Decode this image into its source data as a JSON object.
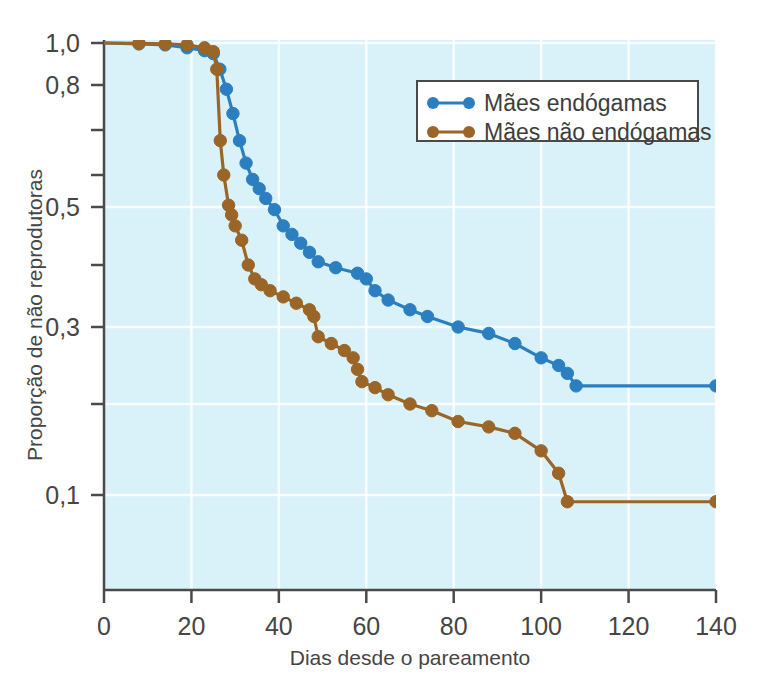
{
  "chart_data": {
    "type": "line",
    "title": "",
    "xlabel": "Dias desde o pareamento",
    "ylabel": "Proporção de não reprodutoras",
    "xlim": [
      0,
      140
    ],
    "ylim": [
      0.07,
      1.0
    ],
    "yscale": "log",
    "grid": true,
    "legend_position": "top-right",
    "background_color": "#d9f1f8",
    "grid_color": "#ffffff",
    "xticks": [
      0,
      20,
      40,
      60,
      80,
      100,
      120,
      140
    ],
    "xtick_labels": [
      "0",
      "20",
      "40",
      "60",
      "80",
      "100",
      "120",
      "140"
    ],
    "yticks": [
      1.0,
      0.8,
      0.7,
      0.6,
      0.5,
      0.4,
      0.3,
      0.2,
      0.1
    ],
    "ytick_labels": [
      "1,0",
      "0,8",
      "",
      "",
      "0,5",
      "",
      "0,3",
      "",
      "0,1"
    ],
    "ytick_labeled": [
      true,
      true,
      false,
      false,
      true,
      false,
      true,
      false,
      true
    ],
    "series": [
      {
        "name": "Mães endógamas",
        "color": "#2b7fc0",
        "marker": "circle",
        "points": [
          [
            0,
            1.0
          ],
          [
            8,
            0.995
          ],
          [
            14,
            0.99
          ],
          [
            19,
            0.975
          ],
          [
            23,
            0.96
          ],
          [
            25,
            0.945
          ],
          [
            26.5,
            0.87
          ],
          [
            28,
            0.79
          ],
          [
            29.5,
            0.735
          ],
          [
            31,
            0.675
          ],
          [
            32.5,
            0.625
          ],
          [
            34,
            0.585
          ],
          [
            35.5,
            0.555
          ],
          [
            37,
            0.525
          ],
          [
            39,
            0.495
          ],
          [
            41,
            0.465
          ],
          [
            43,
            0.45
          ],
          [
            45,
            0.435
          ],
          [
            47,
            0.42
          ],
          [
            49,
            0.405
          ],
          [
            53,
            0.395
          ],
          [
            58,
            0.385
          ],
          [
            60,
            0.375
          ],
          [
            62,
            0.355
          ],
          [
            65,
            0.34
          ],
          [
            70,
            0.325
          ],
          [
            74,
            0.315
          ],
          [
            81,
            0.3
          ],
          [
            88,
            0.29
          ],
          [
            94,
            0.275
          ],
          [
            100,
            0.255
          ],
          [
            104,
            0.245
          ],
          [
            106,
            0.235
          ],
          [
            108,
            0.22
          ],
          [
            140,
            0.22
          ]
        ]
      },
      {
        "name": "Mães não endógamas",
        "color": "#9a6526",
        "marker": "circle",
        "points": [
          [
            0,
            1.0
          ],
          [
            8,
            0.998
          ],
          [
            14,
            0.995
          ],
          [
            19,
            0.99
          ],
          [
            23,
            0.975
          ],
          [
            25,
            0.955
          ],
          [
            25.8,
            0.87
          ],
          [
            26.6,
            0.675
          ],
          [
            27.4,
            0.6
          ],
          [
            28.5,
            0.505
          ],
          [
            29.2,
            0.485
          ],
          [
            30,
            0.465
          ],
          [
            31.5,
            0.44
          ],
          [
            33,
            0.4
          ],
          [
            34.5,
            0.375
          ],
          [
            36,
            0.365
          ],
          [
            38,
            0.355
          ],
          [
            41,
            0.345
          ],
          [
            44,
            0.335
          ],
          [
            47,
            0.325
          ],
          [
            48,
            0.315
          ],
          [
            49,
            0.285
          ],
          [
            52,
            0.275
          ],
          [
            55,
            0.265
          ],
          [
            57,
            0.255
          ],
          [
            58,
            0.24
          ],
          [
            59,
            0.225
          ],
          [
            62,
            0.218
          ],
          [
            65,
            0.21
          ],
          [
            70,
            0.2
          ],
          [
            75,
            0.19
          ],
          [
            81,
            0.175
          ],
          [
            88,
            0.168
          ],
          [
            94,
            0.16
          ],
          [
            100,
            0.14
          ],
          [
            104,
            0.118
          ],
          [
            106,
            0.095
          ],
          [
            140,
            0.095
          ]
        ]
      }
    ]
  },
  "legend": {
    "items": [
      {
        "label": "Mães endógamas",
        "color": "#2b7fc0"
      },
      {
        "label": "Mães não endógamas",
        "color": "#9a6526"
      }
    ]
  },
  "axes": {
    "y_title": "Proporção de não reprodutoras",
    "x_title": "Dias desde o pareamento",
    "y_labels": [
      "1,0",
      "0,8",
      "0,5",
      "0,3",
      "0,1"
    ],
    "x_labels": [
      "0",
      "20",
      "40",
      "60",
      "80",
      "100",
      "120",
      "140"
    ]
  }
}
